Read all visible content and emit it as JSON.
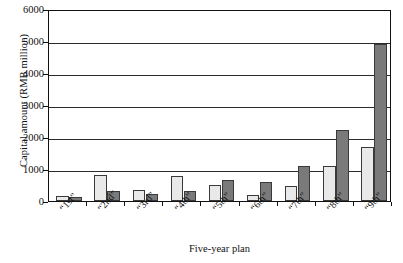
{
  "chart_data": {
    "type": "bar",
    "title": "",
    "xlabel": "Five-year plan",
    "ylabel": "Capital amount (RMB million)",
    "categories": [
      "“1st”",
      "“2nd”",
      "“3rd”",
      "“4th”",
      "“5th”",
      "“6th”",
      "“7th”",
      "“8th”",
      "“9th”"
    ],
    "series": [
      {
        "name": "series-1",
        "color": "#e9e9e9",
        "values": [
          170,
          800,
          330,
          790,
          490,
          200,
          480,
          1100,
          1700
        ]
      },
      {
        "name": "series-2",
        "color": "#7a7a7a",
        "values": [
          120,
          300,
          210,
          310,
          660,
          590,
          1100,
          2230,
          4900
        ]
      }
    ],
    "ylim": [
      0,
      6000
    ],
    "yticks": [
      0,
      1000,
      2000,
      3000,
      4000,
      5000,
      6000
    ],
    "ytick_labels": [
      "0",
      "1000",
      "2000",
      "3000",
      "4000",
      "5000",
      "6000"
    ],
    "grid": true,
    "grid_axis": "y",
    "legend": "none"
  }
}
